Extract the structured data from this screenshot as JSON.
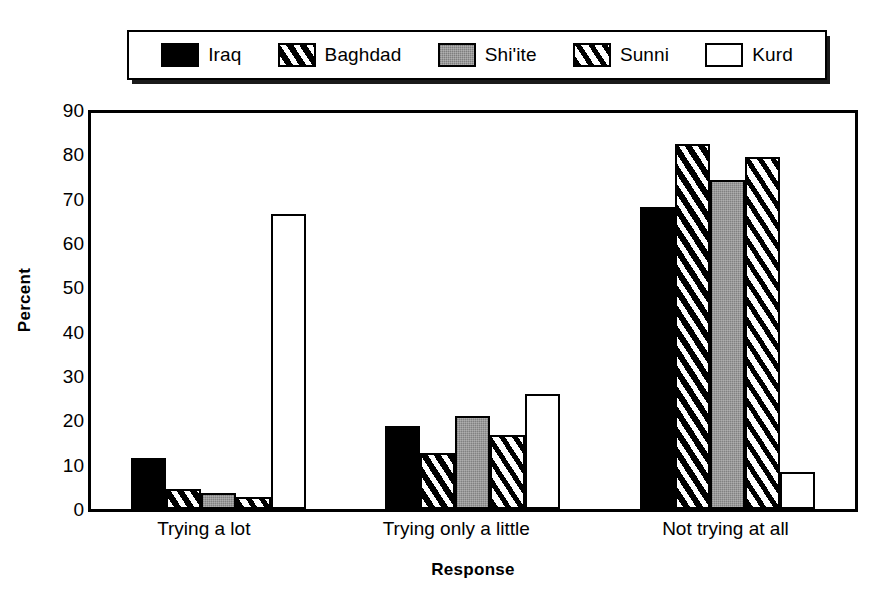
{
  "chart_data": {
    "type": "bar",
    "title": "",
    "xlabel": "Response",
    "ylabel": "Percent",
    "ylim": [
      0,
      90
    ],
    "ytick_step": 10,
    "yticks": [
      90,
      80,
      70,
      60,
      50,
      40,
      30,
      20,
      10,
      0
    ],
    "grid": false,
    "legend_position": "top",
    "categories": [
      "Trying a lot",
      "Trying only a little",
      "Not trying at all"
    ],
    "series": [
      {
        "name": "Iraq",
        "swatch": "solid-black-icon",
        "color": "#000000",
        "values": [
          11.4,
          18.8,
          68.2
        ]
      },
      {
        "name": "Baghdad",
        "swatch": "diagonal-hatch-on-black-icon",
        "color": "#000000",
        "values": [
          4.5,
          12.7,
          82.4
        ]
      },
      {
        "name": "Shi'ite",
        "swatch": "gray-fill-icon",
        "color": "#9a9a9a",
        "values": [
          3.7,
          20.9,
          74.3
        ]
      },
      {
        "name": "Sunni",
        "swatch": "diagonal-hatch-on-white-icon",
        "color": "#ffffff",
        "values": [
          2.8,
          16.8,
          79.4
        ]
      },
      {
        "name": "Kurd",
        "swatch": "white-fill-icon",
        "color": "#ffffff",
        "values": [
          66.5,
          25.9,
          8.4
        ]
      }
    ]
  }
}
